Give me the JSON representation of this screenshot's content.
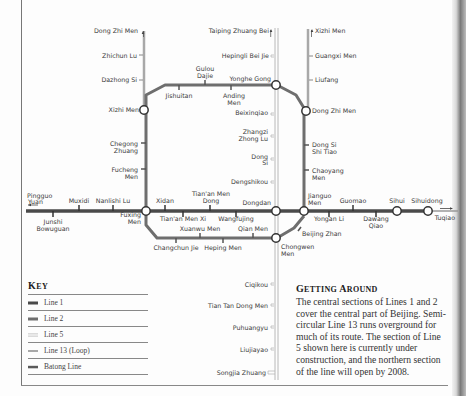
{
  "colors": {
    "line1": "#4a4a4a",
    "line2": "#6e6e6e",
    "line5": "#b8b8b8",
    "line13": "#a8a8a8",
    "batong": "#5a5a5a",
    "text": "#3a3a3a"
  },
  "stations": {
    "line13_west": [
      "Dong Zhi Men",
      "Zhichun Lu",
      "Dazhong Si",
      "Xizhi Men"
    ],
    "line5": [
      "Taiping Zhuang Bei",
      "Hepingli Bei Jie",
      "Yonghe Gong",
      "Beixinqiao",
      "Zhangzi Zhong Lu",
      "Dong Si",
      "Dengshikou",
      "Dongdan",
      "Chongwen Men",
      "Ciqikou",
      "Tian Tan Dong Men",
      "Puhuangyu",
      "Liujiayao",
      "Songjia Zhuang"
    ],
    "line13_east": [
      "Xizhi Men",
      "Guangxi Men",
      "Liufang",
      "Dong Zhi Men"
    ],
    "line2_north": [
      "Xizhi Men",
      "Jishuitan",
      "Gulou Dajie",
      "Anding Men",
      "Yonghe Gong",
      "Dong Zhi Men"
    ],
    "line2_west": [
      "Chegong Zhuang",
      "Fucheng Men",
      "Fuxing Men"
    ],
    "line2_east": [
      "Dong Si Shi Tiao",
      "Chaoyang Men",
      "Jianguo Men"
    ],
    "line2_south": [
      "Changchun Jie",
      "Xuanwu Men",
      "Heping Men",
      "Qian Men",
      "Chongwen Men",
      "Beijing Zhan"
    ],
    "line1": [
      "Pingguo Yuan",
      "Junshi Bowuguan",
      "Muxidi",
      "Nanlishi Lu",
      "Fuxing Men",
      "Xidan",
      "Tian'an Men Xi",
      "Tian'an Men Dong",
      "Wangfujing",
      "Dongdan",
      "Jianguo Men",
      "Yongan Li",
      "Guomao",
      "Dawang Qiao",
      "Sihui"
    ],
    "batong": [
      "Sihui",
      "Sihuidong",
      "Tuqiao"
    ]
  },
  "labels": {
    "dongzhimen_w": "Dong Zhi Men",
    "zhichunlu": "Zhichun Lu",
    "dazhongsi": "Dazhong Si",
    "xizhimen_w": "Xizhi Men",
    "taipingzhuangbei": "Taiping Zhuang Bei",
    "hepinglibeijie": "Hepingli Bei Jie",
    "yonghegong": "Yonghe Gong",
    "xizhimen_e": "Xizhi Men",
    "guangximen": "Guangxi Men",
    "liufang": "Liufang",
    "dongzhimen_e": "Dong Zhi Men",
    "gulou1": "Gulou",
    "gulou2": "Dajie",
    "jishuitan": "Jishuitan",
    "anding1": "Anding",
    "anding2": "Men",
    "beixinqiao": "Beixinqiao",
    "zhangzi1": "Zhangzi",
    "zhangzi2": "Zhong Lu",
    "dongsi1": "Dong",
    "dongsi2": "Si",
    "dengshikou": "Dengshikou",
    "chegong1": "Chegong",
    "chegong2": "Zhuang",
    "fucheng1": "Fucheng",
    "fucheng2": "Men",
    "dongsishitiao1": "Dong Si",
    "dongsishitiao2": "Shi Tiao",
    "chaoyang1": "Chaoyang",
    "chaoyang2": "Men",
    "pingguo1": "Pingguo",
    "pingguo2": "Yuan",
    "muxidi": "Muxidi",
    "nanlishilu": "Nanlishi Lu",
    "xidan": "Xidan",
    "tiananmendong1": "Tian'an Men",
    "tiananmendong2": "Dong",
    "dongdan": "Dongdan",
    "jianguo1": "Jianguo",
    "jianguo2": "Men",
    "guomao": "Guomao",
    "sihui": "Sihui",
    "sihuidong": "Sihuidong",
    "tuqiao": "Tuqiao",
    "junshi1": "Junshi",
    "junshi2": "Bowuguan",
    "fuxing1": "Fuxing",
    "fuxing2": "Men",
    "tiananmenxi": "Tian'an Men Xi",
    "wangfujing": "Wangfujing",
    "yonganli": "Yongan Li",
    "dawang1": "Dawang",
    "dawang2": "Qiao",
    "xuanwumen": "Xuanwu Men",
    "qianmen": "Qian Men",
    "beijingzhan": "Beijing Zhan",
    "changchunjie": "Changchun Jie",
    "hepingmen": "Heping Men",
    "chongwen1": "Chongwen",
    "chongwen2": "Men",
    "ciqikou": "Ciqikou",
    "tiantandongmen": "Tian Tan Dong Men",
    "puhuangyu": "Puhuangyu",
    "liujiayao": "Liujiayao",
    "songjiazhuang": "Songjia Zhuang"
  },
  "key": {
    "title_first": "K",
    "title_rest": "EY",
    "items": [
      {
        "label": "Line 1",
        "swatch": "solid-dark"
      },
      {
        "label": "Line 2",
        "swatch": "solid-mid"
      },
      {
        "label": "Line 5",
        "swatch": "double-light"
      },
      {
        "label": "Line 13 (Loop)",
        "swatch": "solid-light"
      },
      {
        "label": "Batong Line",
        "swatch": "solid-dark-thin"
      }
    ]
  },
  "about": {
    "title_first_1": "G",
    "title_rest_1": "ETTING ",
    "title_first_2": "A",
    "title_rest_2": "ROUND",
    "body": "The central sections of Lines 1 and 2 cover the central part of Beijing. Semi-circular Line 13 runs overground for much of its route. The section of Line 5 shown here is currently under construction, and the northern section of the line will open by 2008."
  }
}
